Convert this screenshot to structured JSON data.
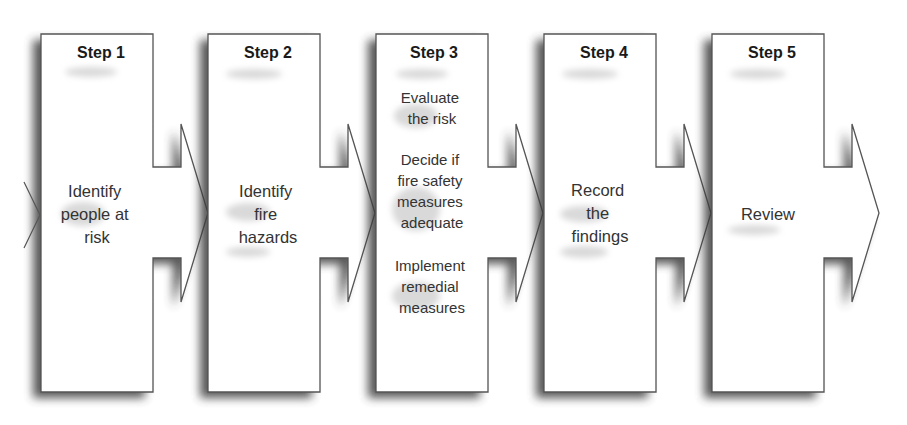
{
  "diagram": {
    "type": "process-flow",
    "colors": {
      "box_fill": "#ffffff",
      "box_stroke": "#555555",
      "shadow": "#3a3a3a",
      "title_text": "#1a1a1a",
      "body_text": "#333333"
    },
    "steps": [
      {
        "title": "Step 1",
        "lines": [
          "Identify",
          "people at",
          "risk"
        ]
      },
      {
        "title": "Step 2",
        "lines": [
          "Identify",
          "fire",
          "hazards"
        ]
      },
      {
        "title": "Step 3",
        "groups": [
          [
            "Evaluate",
            "the risk"
          ],
          [
            "Decide if",
            "fire safety",
            "measures",
            "adequate"
          ],
          [
            "Implement",
            "remedial",
            "measures"
          ]
        ]
      },
      {
        "title": "Step 4",
        "lines": [
          "Record",
          "the",
          "findings"
        ]
      },
      {
        "title": "Step 5",
        "lines": [
          "Review"
        ]
      }
    ]
  }
}
